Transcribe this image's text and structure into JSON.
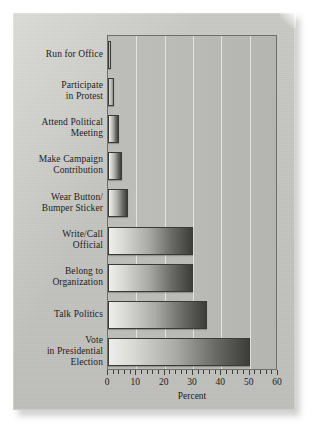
{
  "figure": {
    "background_color": "#c5c5c1",
    "plot_border_color": "#6e6e6a",
    "gridline_color": "#e9e9e6",
    "bar_edge_color": "#3a3a37",
    "text_color": "#1d1d1b"
  },
  "chart_data": {
    "type": "bar",
    "orientation": "horizontal",
    "title": "",
    "xlabel": "Percent",
    "ylabel": "",
    "xlim": [
      0,
      60
    ],
    "xticks": [
      0,
      10,
      20,
      30,
      40,
      50,
      60
    ],
    "xticklabels": [
      "0",
      "10",
      "20",
      "30",
      "40",
      "50",
      "60"
    ],
    "minor_tick_interval": 2,
    "grid": "vertical",
    "legend": "none",
    "categories": [
      "Run for Office",
      "Participate\nin Protest",
      "Attend Political\nMeeting",
      "Make Campaign\nContribution",
      "Wear Button/\nBumper Sticker",
      "Write/Call\nOfficial",
      "Belong to\nOrganization",
      "Talk Politics",
      "Vote\nin Presidential\nElection"
    ],
    "values": [
      1,
      2,
      4,
      5,
      7,
      30,
      30,
      35,
      50
    ]
  }
}
